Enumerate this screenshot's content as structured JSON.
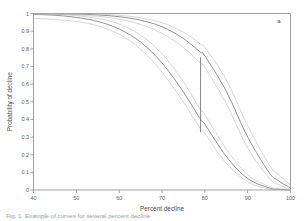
{
  "figure": {
    "panel_label": "a",
    "caption_fragment": "Fig. 1. Example of curves for several percent decline"
  },
  "chart_data": {
    "type": "line",
    "title": "",
    "xlabel": "Percent decline",
    "ylabel": "Probability of decline",
    "xlim": [
      40,
      100
    ],
    "ylim": [
      0,
      1
    ],
    "xticks": [
      40,
      50,
      60,
      70,
      80,
      90,
      100
    ],
    "xtick_labels": [
      "40",
      "50",
      "60",
      "70",
      "80",
      "90",
      "100"
    ],
    "yticks": [
      0,
      0.1,
      0.2,
      0.3,
      0.4,
      0.5,
      0.6,
      0.7,
      0.8,
      0.9,
      1
    ],
    "ytick_labels": [
      "0",
      "0.1",
      "0.2",
      "0.3",
      "0.4",
      "0.5",
      "0.6",
      "0.7",
      "0.8",
      "0.9",
      "1"
    ],
    "grid": false,
    "legend": "none",
    "colors": {
      "fit_line": "#6b6b6b",
      "confidence_band": "#b9b9b9",
      "axis": "#7a7a7a",
      "annotation_line": "#6b6b6b",
      "background": "#ffffff"
    },
    "x": [
      40,
      45,
      50,
      55,
      60,
      65,
      70,
      75,
      79,
      80,
      85,
      90,
      95,
      97,
      100
    ],
    "series": [
      {
        "name": "curve-1-fit",
        "role": "fit",
        "values": [
          0.995,
          0.99,
          0.978,
          0.955,
          0.912,
          0.838,
          0.72,
          0.555,
          0.4,
          0.373,
          0.19,
          0.065,
          0.012,
          0.004,
          0.0
        ]
      },
      {
        "name": "curve-1-upper",
        "role": "upper",
        "values": [
          0.999,
          0.996,
          0.988,
          0.972,
          0.94,
          0.878,
          0.772,
          0.612,
          0.455,
          0.428,
          0.232,
          0.086,
          0.02,
          0.009,
          0.002
        ]
      },
      {
        "name": "curve-1-lower",
        "role": "lower",
        "values": [
          0.972,
          0.966,
          0.955,
          0.93,
          0.882,
          0.798,
          0.668,
          0.498,
          0.345,
          0.32,
          0.152,
          0.046,
          0.006,
          0.002,
          0.0
        ]
      },
      {
        "name": "curve-2-fit",
        "role": "fit",
        "values": [
          1.0,
          0.999,
          0.997,
          0.992,
          0.982,
          0.962,
          0.925,
          0.858,
          0.78,
          0.76,
          0.56,
          0.3,
          0.1,
          0.055,
          0.012
        ]
      },
      {
        "name": "curve-2-upper",
        "role": "upper",
        "values": [
          1.0,
          1.0,
          0.999,
          0.996,
          0.99,
          0.976,
          0.948,
          0.894,
          0.826,
          0.808,
          0.625,
          0.365,
          0.145,
          0.09,
          0.03
        ]
      },
      {
        "name": "curve-2-lower",
        "role": "lower",
        "values": [
          0.998,
          0.996,
          0.992,
          0.984,
          0.968,
          0.938,
          0.888,
          0.808,
          0.718,
          0.695,
          0.49,
          0.238,
          0.068,
          0.034,
          0.0
        ]
      }
    ],
    "annotations": [
      {
        "name": "vertical-probability-interval",
        "type": "vline-segment",
        "x": 79,
        "y_bottom": 0.327,
        "y_top": 0.752
      }
    ]
  }
}
